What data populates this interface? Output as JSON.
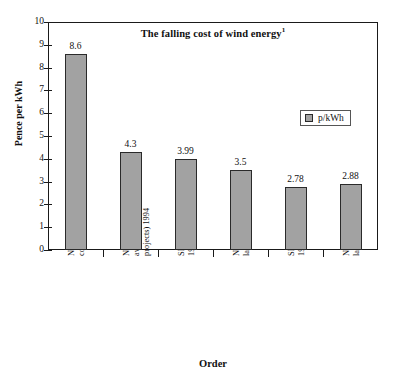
{
  "chart_data": {
    "type": "bar",
    "title": "The falling cost of wind energy",
    "title_superscript": "1",
    "xlabel": "Order",
    "ylabel": "Pence per kWh",
    "ylim": [
      0,
      10
    ],
    "ytick_step": 1,
    "grid": false,
    "legend_position": "inside-top-right",
    "categories": [
      "NFFO2 (if 15 year contracts)",
      "NFFO3 (weighted average, large projects) 1994",
      "SRO1 (average) 1994",
      "NFFO4 (average, large projects) 1997",
      "SRO2 (average) 1997",
      "NFFO4 (average, large projects) 1998"
    ],
    "category_lines": [
      "NFFO2 (if 15 year\ncontracts)",
      "NFFO3 (weighted\naverage, large\nprojects) 1994",
      "SRO1 (average)\n1994",
      "NFFO4 (average,\nlarge projects) 1997",
      "SRO2 (average)\n1997",
      "NFFO4 (average,\nlarge projects) 1998"
    ],
    "series": [
      {
        "name": "p/kWh",
        "values": [
          8.6,
          4.3,
          3.99,
          3.5,
          2.78,
          2.88
        ],
        "value_labels": [
          "8.6",
          "4.3",
          "3.99",
          "3.5",
          "2.78",
          "2.88"
        ],
        "color": "#a2a2a2",
        "border_color": "#2a2a2a"
      }
    ],
    "ytick_labels": [
      "0",
      "1",
      "2",
      "3",
      "4",
      "5",
      "6",
      "7",
      "8",
      "9",
      "10"
    ]
  },
  "legend": {
    "entries": [
      {
        "label": "p/kWh",
        "swatch_color": "#a2a2a2"
      }
    ]
  },
  "colors": {
    "background": "#ffffff",
    "axis": "#1a1a1a",
    "bar_fill": "#a2a2a2",
    "bar_border": "#2a2a2a",
    "text": "#111111"
  }
}
